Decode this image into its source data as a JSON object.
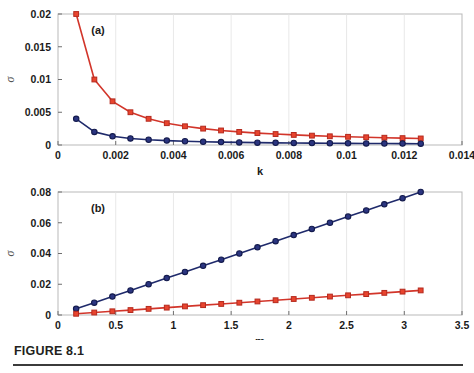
{
  "figure": {
    "caption": "FIGURE 8.1",
    "panel_a_tag": "(a)",
    "panel_b_tag": "(b)"
  },
  "colors": {
    "series_blue_line": "#1f2a6b",
    "series_blue_marker_face": "#2b3580",
    "series_blue_marker_edge": "#141b4d",
    "series_red_line": "#d2352a",
    "series_red_marker_face": "#e8442e",
    "series_red_marker_edge": "#b42a1e",
    "grid": "#e2e2e2",
    "frame": "#b9b9b9",
    "text": "#1a1a1a",
    "rule": "#3b3b3b"
  },
  "chart_data": [
    {
      "type": "line",
      "panel": "a",
      "title": "(a)",
      "xlabel": "k",
      "ylabel": "σ",
      "xlim": [
        0,
        0.014
      ],
      "ylim": [
        0,
        0.02
      ],
      "xticks": [
        0,
        0.002,
        0.004,
        0.006,
        0.008,
        0.01,
        0.012,
        0.014
      ],
      "xticklabels": [
        "0",
        "0.002",
        "0.004",
        "0.006",
        "0.008",
        "0.01",
        "0.012",
        "0.014"
      ],
      "yticks": [
        0,
        0.005,
        0.01,
        0.015,
        0.02
      ],
      "yticklabels": [
        "0",
        "0.005",
        "0.01",
        "0.015",
        "0.02"
      ],
      "grid": "vertical",
      "legend": "none",
      "x": [
        0.00063,
        0.00126,
        0.00189,
        0.00251,
        0.00314,
        0.00377,
        0.0044,
        0.00503,
        0.00565,
        0.00628,
        0.00691,
        0.00754,
        0.00817,
        0.0088,
        0.00942,
        0.01005,
        0.01068,
        0.01131,
        0.01194,
        0.01257
      ],
      "series": [
        {
          "name": "red-square-series",
          "marker": "square",
          "color": "#d2352a",
          "values": [
            0.02,
            0.01,
            0.00667,
            0.005,
            0.004,
            0.00333,
            0.00286,
            0.0025,
            0.00222,
            0.002,
            0.00182,
            0.00167,
            0.00154,
            0.00143,
            0.00133,
            0.00125,
            0.00118,
            0.00111,
            0.00105,
            0.001
          ]
        },
        {
          "name": "blue-circle-series",
          "marker": "circle",
          "color": "#1f2a6b",
          "values": [
            0.004,
            0.002,
            0.00133,
            0.001,
            0.0008,
            0.00067,
            0.00057,
            0.0005,
            0.00044,
            0.0004,
            0.00036,
            0.00033,
            0.00031,
            0.00029,
            0.00027,
            0.00025,
            0.00024,
            0.00022,
            0.00021,
            0.0002
          ]
        }
      ]
    },
    {
      "type": "line",
      "panel": "b",
      "title": "(b)",
      "xlabel": "m",
      "ylabel": "σ",
      "xlim": [
        0,
        3.5
      ],
      "ylim": [
        0,
        0.08
      ],
      "xticks": [
        0,
        0.5,
        1,
        1.5,
        2,
        2.5,
        3,
        3.5
      ],
      "xticklabels": [
        "0",
        "0.5",
        "1",
        "1.5",
        "2",
        "2.5",
        "3",
        "3.5"
      ],
      "yticks": [
        0,
        0.02,
        0.04,
        0.06,
        0.08
      ],
      "yticklabels": [
        "0",
        "0.02",
        "0.04",
        "0.06",
        "0.08"
      ],
      "grid": "vertical",
      "legend": "none",
      "x": [
        0.157,
        0.314,
        0.471,
        0.628,
        0.785,
        0.942,
        1.1,
        1.257,
        1.414,
        1.571,
        1.728,
        1.885,
        2.042,
        2.199,
        2.356,
        2.513,
        2.67,
        2.827,
        2.985,
        3.142
      ],
      "series": [
        {
          "name": "blue-circle-series",
          "marker": "circle",
          "color": "#1f2a6b",
          "values": [
            0.004,
            0.008,
            0.012,
            0.016,
            0.02,
            0.024,
            0.028,
            0.032,
            0.036,
            0.04,
            0.044,
            0.048,
            0.052,
            0.056,
            0.06,
            0.064,
            0.068,
            0.072,
            0.076,
            0.08
          ]
        },
        {
          "name": "red-square-series",
          "marker": "square",
          "color": "#d2352a",
          "values": [
            0.0008,
            0.0016,
            0.0024,
            0.0032,
            0.004,
            0.0048,
            0.0056,
            0.0064,
            0.0072,
            0.008,
            0.0088,
            0.0096,
            0.0104,
            0.0112,
            0.012,
            0.0128,
            0.0136,
            0.0144,
            0.0152,
            0.016
          ]
        }
      ]
    }
  ]
}
